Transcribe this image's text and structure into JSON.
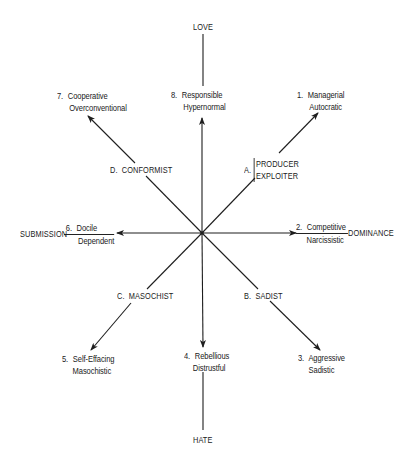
{
  "diagram": {
    "type": "circumplex",
    "center": [
      202,
      233
    ],
    "axes": {
      "top": "LOVE",
      "bottom": "HATE",
      "left": "SUBMISSION",
      "right": "DOMINANCE"
    },
    "types": [
      {
        "num": "1.",
        "line1": "Managerial",
        "line2": "Autocratic",
        "direction": "up-right"
      },
      {
        "num": "2.",
        "line1": "Competitive",
        "line2": "Narcissistic",
        "direction": "right"
      },
      {
        "num": "3.",
        "line1": "Aggressive",
        "line2": "Sadistic",
        "direction": "down-right"
      },
      {
        "num": "4.",
        "line1": "Rebellious",
        "line2": "Distrustful",
        "direction": "down"
      },
      {
        "num": "5.",
        "line1": "Self-Effacing",
        "line2": "Masochistic",
        "direction": "down-left"
      },
      {
        "num": "6.",
        "line1": "Docile",
        "line2": "Dependent",
        "direction": "left"
      },
      {
        "num": "7.",
        "line1": "Cooperative",
        "line2": "Overconventional",
        "direction": "up-left"
      },
      {
        "num": "8.",
        "line1": "Responsible",
        "line2": "Hypernormal",
        "direction": "up"
      }
    ],
    "quadrants": {
      "A": {
        "letter": "A.",
        "line1": "PRODUCER",
        "line2": "EXPLOITER"
      },
      "B": {
        "letter": "B.",
        "label": "SADIST"
      },
      "C": {
        "letter": "C.",
        "label": "MASOCHIST"
      },
      "D": {
        "letter": "D.",
        "label": "CONFORMIST"
      }
    },
    "line_color": "#1e1e1e"
  }
}
